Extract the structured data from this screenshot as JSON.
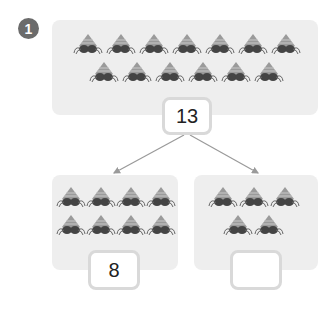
{
  "problem": {
    "number": "1"
  },
  "total": {
    "crab_count": 13,
    "rows": [
      7,
      6
    ],
    "value": "13"
  },
  "parts": [
    {
      "crab_count": 8,
      "rows": [
        4,
        4
      ],
      "value": "8"
    },
    {
      "crab_count": 5,
      "rows": [
        3,
        2
      ],
      "value": ""
    }
  ],
  "colors": {
    "panel": "#eeeeee",
    "badge": "#6b6b6b",
    "arrow": "#9a9a9a",
    "box_border": "#d9d9d9"
  }
}
